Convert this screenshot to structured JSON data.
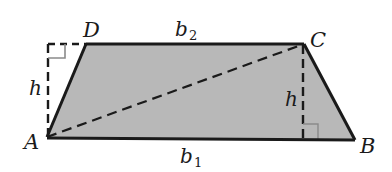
{
  "diagram": {
    "type": "trapezoid-area",
    "fill_color": "#b8b8b8",
    "stroke_color": "#1a1a1a",
    "right_angle_color": "#8a8a8a",
    "vertices": {
      "A": {
        "label": "A",
        "x": 47,
        "y": 137
      },
      "B": {
        "label": "B",
        "x": 355,
        "y": 140
      },
      "C": {
        "label": "C",
        "x": 304,
        "y": 44
      },
      "D": {
        "label": "D",
        "x": 86,
        "y": 44
      }
    },
    "labels": {
      "A": "A",
      "B": "B",
      "C": "C",
      "D": "D",
      "top_base": "b",
      "top_base_sub": "2",
      "bottom_base": "b",
      "bottom_base_sub": "1",
      "height_left": "h",
      "height_right": "h"
    },
    "segments": [
      {
        "name": "base-b1",
        "from": "A",
        "to": "B",
        "style": "solid"
      },
      {
        "name": "base-b2",
        "from": "D",
        "to": "C",
        "style": "solid"
      },
      {
        "name": "leg-AD",
        "from": "A",
        "to": "D",
        "style": "solid"
      },
      {
        "name": "leg-CB",
        "from": "C",
        "to": "B",
        "style": "solid"
      },
      {
        "name": "diagonal-AC",
        "from": "A",
        "to": "C",
        "style": "dashed"
      },
      {
        "name": "height-left",
        "style": "dashed"
      },
      {
        "name": "height-right",
        "style": "dashed"
      }
    ]
  }
}
